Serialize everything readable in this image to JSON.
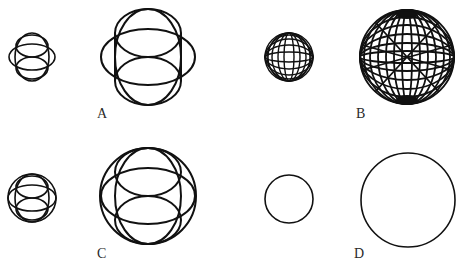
{
  "figure": {
    "panels": [
      {
        "id": "A",
        "label": "A",
        "description": "Sphere formed by intersecting ellipses (sparse, 4 ellipses)"
      },
      {
        "id": "B",
        "label": "B",
        "description": "Dense wireframe sphere (many latitude/longitude lines)"
      },
      {
        "id": "C",
        "label": "C",
        "description": "Circle outline with interior intersecting ellipses"
      },
      {
        "id": "D",
        "label": "D",
        "description": "Plain circle outline"
      }
    ],
    "stroke_color": "#111111",
    "background": "#ffffff"
  }
}
